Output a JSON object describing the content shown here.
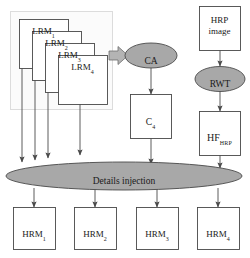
{
  "diagram": {
    "colors": {
      "node_fill": "#ffffff",
      "node_stroke": "#444444",
      "ellipse_fill": "#a8a8a8",
      "ellipse_stroke": "#4a4a4a",
      "group_fill": "#fbfbfb",
      "group_stroke": "#d8d8d8",
      "arrow_color": "#4a4a4a",
      "block_arrow_fill": "#b4b4b4",
      "text_color": "#1a1a1a"
    },
    "group_box": {
      "name": "lrm-group",
      "label": ""
    },
    "lrm_nodes": [
      {
        "id": "lrm1",
        "main": "LRM",
        "sub": "1"
      },
      {
        "id": "lrm2",
        "main": "LRM",
        "sub": "2"
      },
      {
        "id": "lrm3",
        "main": "LRM",
        "sub": "3"
      },
      {
        "id": "lrm4",
        "main": "LRM",
        "sub": "4"
      }
    ],
    "hrm_nodes": [
      {
        "id": "hrm1",
        "main": "HRM",
        "sub": "1"
      },
      {
        "id": "hrm2",
        "main": "HRM",
        "sub": "2"
      },
      {
        "id": "hrm3",
        "main": "HRM",
        "sub": "3"
      },
      {
        "id": "hrm4",
        "main": "HRM",
        "sub": "4"
      }
    ],
    "ca_ellipse": {
      "label": "CA"
    },
    "c4_box": {
      "main": "C",
      "sub": "4"
    },
    "hrp_box": {
      "line1": "HRP",
      "line2": "image"
    },
    "rwt_ellipse": {
      "label": "RWT"
    },
    "hf_box": {
      "main": "HF",
      "sub": "HRP"
    },
    "details_ellipse": {
      "label": "Details injection"
    },
    "block_arrow": {
      "name": "block-arrow-to-ca"
    }
  }
}
